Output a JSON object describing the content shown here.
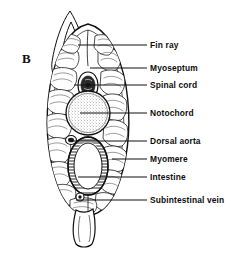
{
  "figure": {
    "panel_letter": "B",
    "line_color": "#111111",
    "fill_color": "#ffffff",
    "background": "#ffffff"
  },
  "labels": [
    {
      "id": "fin-ray",
      "text": "Fin ray",
      "text_x": 150,
      "text_y": 41,
      "leader_x1": 78,
      "leader_y1": 45,
      "leader_x2": 147,
      "leader_y2": 45
    },
    {
      "id": "myoseptum",
      "text": "Myoseptum",
      "text_x": 150,
      "text_y": 64,
      "leader_x1": 90,
      "leader_y1": 68,
      "leader_x2": 147,
      "leader_y2": 68
    },
    {
      "id": "spinal-cord",
      "text": "Spinal cord",
      "text_x": 150,
      "text_y": 81,
      "leader_x1": 74,
      "leader_y1": 85,
      "leader_x2": 147,
      "leader_y2": 85
    },
    {
      "id": "notochord",
      "text": "Notochord",
      "text_x": 150,
      "text_y": 109,
      "leader_x1": 80,
      "leader_y1": 113,
      "leader_x2": 147,
      "leader_y2": 113
    },
    {
      "id": "dorsal-aorta",
      "text": "Dorsal aorta",
      "text_x": 150,
      "text_y": 137,
      "leader_x1": 71,
      "leader_y1": 141,
      "leader_x2": 147,
      "leader_y2": 141
    },
    {
      "id": "myomere",
      "text": "Myomere",
      "text_x": 150,
      "text_y": 155,
      "leader_x1": 112,
      "leader_y1": 159,
      "leader_x2": 147,
      "leader_y2": 159
    },
    {
      "id": "intestine",
      "text": "Intestine",
      "text_x": 150,
      "text_y": 173,
      "leader_x1": 78,
      "leader_y1": 177,
      "leader_x2": 147,
      "leader_y2": 177
    },
    {
      "id": "subintestinal-vein",
      "text": "Subintestinal vein",
      "text_x": 150,
      "text_y": 196,
      "leader_x1": 76,
      "leader_y1": 200,
      "leader_x2": 147,
      "leader_y2": 200
    }
  ],
  "structures": [
    {
      "id": "dorsal-fin",
      "name": "dorsal fin ray"
    },
    {
      "id": "body-wall",
      "name": "body outline"
    },
    {
      "id": "notochord-circle",
      "name": "notochord"
    },
    {
      "id": "spinal-cord-mass",
      "name": "spinal cord"
    },
    {
      "id": "intestine-ring",
      "name": "intestine lumen"
    },
    {
      "id": "myomere-blocks",
      "name": "myomere muscle blocks"
    },
    {
      "id": "ventral-fin",
      "name": "ventral fin"
    }
  ]
}
